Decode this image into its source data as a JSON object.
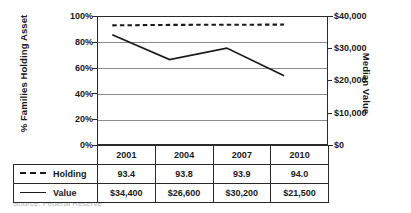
{
  "chart_data": {
    "type": "line",
    "title": "",
    "categories": [
      "2001",
      "2004",
      "2007",
      "2010"
    ],
    "series": [
      {
        "name": "Holding",
        "axis": "left",
        "style": "dashed",
        "unit": "%",
        "values": [
          93.4,
          93.8,
          93.9,
          94.0
        ],
        "display_values": [
          "93.4",
          "93.8",
          "93.9",
          "94.0"
        ]
      },
      {
        "name": "Value",
        "axis": "right",
        "style": "solid",
        "unit": "$",
        "values": [
          34400,
          26600,
          30200,
          21500
        ],
        "display_values": [
          "$34,400",
          "$26,600",
          "$30,200",
          "$21,500"
        ]
      }
    ],
    "left_axis": {
      "label": "% Families Holding Asset",
      "ticks": [
        "0%",
        "20%",
        "40%",
        "60%",
        "80%",
        "100%"
      ],
      "tick_values": [
        0,
        20,
        40,
        60,
        80,
        100
      ],
      "ylim": [
        0,
        100
      ]
    },
    "right_axis": {
      "label": "Median Value",
      "ticks": [
        "$0",
        "$10,000",
        "$20,000",
        "$30,000",
        "$40,000"
      ],
      "tick_values": [
        0,
        10000,
        20000,
        30000,
        40000
      ],
      "ylim": [
        0,
        40000
      ]
    },
    "grid": true,
    "legend_position": "table-below",
    "xlabel": "",
    "ylabel": "% Families Holding Asset"
  },
  "table": {
    "header_row": [
      "",
      "2001",
      "2004",
      "2007",
      "2010"
    ],
    "rows": [
      {
        "label": "Holding",
        "marker": "dashed",
        "cells": [
          "93.4",
          "93.8",
          "93.9",
          "94.0"
        ]
      },
      {
        "label": "Value",
        "marker": "solid",
        "cells": [
          "$34,400",
          "$26,600",
          "$30,200",
          "$21,500"
        ]
      }
    ]
  },
  "source_note": "Source: Federal Reserve"
}
